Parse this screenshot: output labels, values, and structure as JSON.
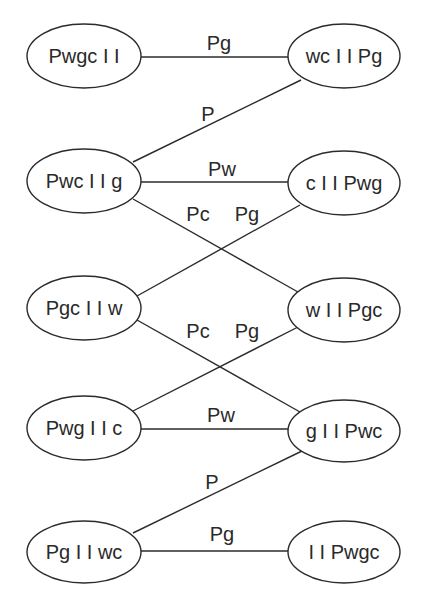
{
  "diagram": {
    "type": "state-transition-graph",
    "nodes": [
      {
        "id": "n1",
        "label": "Pwgc I I",
        "cx": 84,
        "cy": 56
      },
      {
        "id": "n2",
        "label": "wc I I Pg",
        "cx": 344,
        "cy": 56
      },
      {
        "id": "n3",
        "label": "Pwc I I g",
        "cx": 84,
        "cy": 181
      },
      {
        "id": "n4",
        "label": "c I I Pwg",
        "cx": 344,
        "cy": 183
      },
      {
        "id": "n5",
        "label": "Pgc I I w",
        "cx": 84,
        "cy": 308
      },
      {
        "id": "n6",
        "label": "w I I Pgc",
        "cx": 344,
        "cy": 310
      },
      {
        "id": "n7",
        "label": "Pwg I I c",
        "cx": 84,
        "cy": 428
      },
      {
        "id": "n8",
        "label": "g I I Pwc",
        "cx": 344,
        "cy": 431
      },
      {
        "id": "n9",
        "label": "Pg I I wc",
        "cx": 84,
        "cy": 552
      },
      {
        "id": "n10",
        "label": "I I Pwgc",
        "cx": 344,
        "cy": 552
      }
    ],
    "edges": [
      {
        "from": "n1",
        "to": "n2",
        "label": "Pg"
      },
      {
        "from": "n3",
        "to": "n2",
        "label": "P"
      },
      {
        "from": "n3",
        "to": "n4",
        "label": "Pw"
      },
      {
        "from": "n3",
        "to": "n6",
        "label": "Pc"
      },
      {
        "from": "n5",
        "to": "n4",
        "label": "Pg"
      },
      {
        "from": "n5",
        "to": "n8",
        "label": "Pc"
      },
      {
        "from": "n7",
        "to": "n6",
        "label": "Pg"
      },
      {
        "from": "n7",
        "to": "n8",
        "label": "Pw"
      },
      {
        "from": "n9",
        "to": "n8",
        "label": "P"
      },
      {
        "from": "n9",
        "to": "n10",
        "label": "Pg"
      }
    ]
  },
  "colors": {
    "stroke": "#2b2b2b",
    "text": "#2a2a2a",
    "background": "#ffffff"
  }
}
